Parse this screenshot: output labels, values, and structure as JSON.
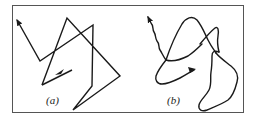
{
  "figure": {
    "panels": [
      {
        "id": "a",
        "label": "(a)",
        "description": "Piecewise-linear random-walk path (straight segments) with arrowheads",
        "path_points": [
          [
            73,
            69
          ],
          [
            42,
            85
          ],
          [
            67,
            18
          ],
          [
            120,
            76
          ],
          [
            73,
            110
          ],
          [
            92,
            86
          ],
          [
            93,
            25
          ],
          [
            40,
            61
          ],
          [
            17,
            20
          ]
        ],
        "start_arrow": {
          "at": [
            55,
            75
          ],
          "direction": "left"
        },
        "end_arrow": {
          "at": [
            17,
            20
          ],
          "direction": "up-left"
        }
      },
      {
        "id": "b",
        "label": "(b)",
        "description": "Smooth, wiggly continuous path resembling a Brownian trajectory with arrowheads",
        "start_arrow": {
          "at": [
            195,
            70
          ],
          "direction": "right"
        },
        "end_arrow": {
          "at": [
            148,
            17
          ],
          "direction": "up"
        }
      }
    ],
    "colors": {
      "stroke": "#1a1a1a",
      "frame": "#555555",
      "background": "#ffffff"
    }
  }
}
